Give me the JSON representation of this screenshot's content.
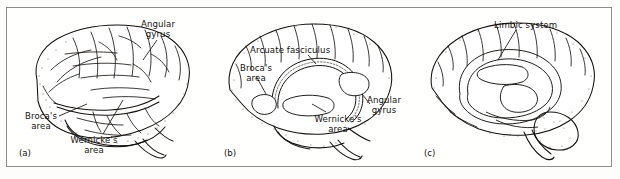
{
  "figure": {
    "panels": [
      {
        "tag": "(a)",
        "view": "lateral-cortex",
        "labels": [
          {
            "name": "angular-gyrus",
            "text": "Angular\ngyrus"
          },
          {
            "name": "brocas-area",
            "text": "Broca's\narea"
          },
          {
            "name": "wernickes-area",
            "text": "Wernicke's\narea"
          }
        ]
      },
      {
        "tag": "(b)",
        "view": "arcuate-fasciculus-cutaway",
        "labels": [
          {
            "name": "arcuate-fasciculus",
            "text": "Arcuate fasciculus"
          },
          {
            "name": "brocas-area",
            "text": "Broca's\narea"
          },
          {
            "name": "wernickes-area",
            "text": "Wernicke's\narea"
          },
          {
            "name": "angular-gyrus",
            "text": "Angular\ngyrus"
          }
        ]
      },
      {
        "tag": "(c)",
        "view": "medial-limbic",
        "labels": [
          {
            "name": "limbic-system",
            "text": "Limbic system"
          }
        ]
      }
    ],
    "colors": {
      "ink": "#14120f",
      "frame": "#8d8d8d",
      "paper": "#fdfdfc"
    }
  }
}
